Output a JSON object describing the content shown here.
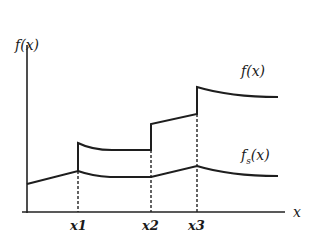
{
  "diagram": {
    "type": "function-plot",
    "y_axis_label": "f(x)",
    "x_axis_label": "x",
    "curves": [
      {
        "name": "f(x)",
        "label": "f(x)",
        "description": "Step-like function with upward jumps at x1, x2, x3; decays between jumps"
      },
      {
        "name": "fs(x)",
        "label_main": "f",
        "label_sub": "s",
        "label_tail": "(x)",
        "description": "Smoothed function, continuous with kinks at x1, x2, x3"
      }
    ],
    "x_ticks": [
      "x1",
      "x2",
      "x3"
    ],
    "colors": {
      "line": "#1e1e1e",
      "background": "#ffffff"
    }
  }
}
